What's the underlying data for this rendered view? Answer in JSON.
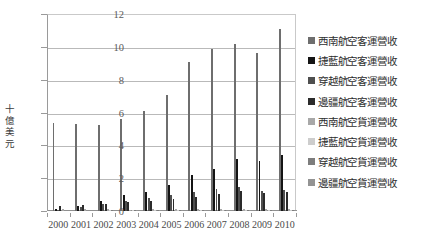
{
  "chart_data": {
    "type": "bar",
    "title": "",
    "xlabel": "",
    "ylabel": "十億美元",
    "ylim": [
      0,
      12
    ],
    "yticks": [
      0,
      2,
      4,
      6,
      8,
      10,
      12
    ],
    "grid": true,
    "legend_position": "right",
    "categories": [
      "2000",
      "2001",
      "2002",
      "2003",
      "2004",
      "2005",
      "2006",
      "2007",
      "2008",
      "2009",
      "2010"
    ],
    "series": [
      {
        "name": "西南航空客運營收",
        "color": "#6e6e6e",
        "values": [
          5.38,
          5.3,
          5.22,
          5.6,
          6.1,
          7.05,
          9.08,
          9.86,
          10.2,
          9.62,
          11.1
        ]
      },
      {
        "name": "捷藍航空客運營收",
        "color": "#141414",
        "values": [
          0.1,
          0.32,
          0.6,
          0.96,
          1.18,
          1.58,
          2.18,
          2.56,
          3.15,
          3.02,
          3.4
        ]
      },
      {
        "name": "穿越航空客運營收",
        "color": "#4f4f4f",
        "values": [
          0.08,
          0.22,
          0.4,
          0.62,
          0.82,
          1.0,
          1.18,
          1.32,
          1.46,
          1.22,
          1.3
        ]
      },
      {
        "name": "邊疆航空客運營收",
        "color": "#2b2b2b",
        "values": [
          0.32,
          0.38,
          0.44,
          0.56,
          0.62,
          0.76,
          0.88,
          1.02,
          1.22,
          1.08,
          1.18
        ]
      },
      {
        "name": "西南航空貨運營收",
        "color": "#a8a8a8",
        "values": [
          0.11,
          0.11,
          0.1,
          0.09,
          0.1,
          0.13,
          0.13,
          0.13,
          0.15,
          0.12,
          0.13
        ]
      },
      {
        "name": "捷藍航空貨運營收",
        "color": "#cdcdcd",
        "values": [
          0.0,
          0.0,
          0.01,
          0.01,
          0.01,
          0.02,
          0.02,
          0.03,
          0.04,
          0.04,
          0.04
        ]
      },
      {
        "name": "穿越航空貨運營收",
        "color": "#7d7d7d",
        "values": [
          0.0,
          0.0,
          0.01,
          0.01,
          0.01,
          0.01,
          0.02,
          0.02,
          0.02,
          0.02,
          0.02
        ]
      },
      {
        "name": "邊疆航空貨運營收",
        "color": "#939393",
        "values": [
          0.0,
          0.0,
          0.0,
          0.01,
          0.01,
          0.01,
          0.01,
          0.01,
          0.02,
          0.01,
          0.02
        ]
      }
    ]
  }
}
